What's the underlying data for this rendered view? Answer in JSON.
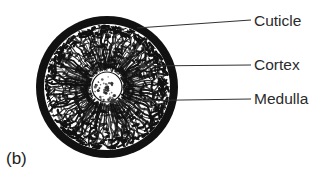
{
  "figure": {
    "panel_letter": "(b)",
    "background_color": "#ffffff",
    "ink_color": "#111111",
    "text_color": "#2b2b2b",
    "faint_bleedthrough_text": ""
  },
  "diagram": {
    "center_x": 107,
    "center_y": 87,
    "outer_radius": 71,
    "cuticle_ring_thickness": 8,
    "cortex_outer_radius": 63,
    "medulla_radius": 15,
    "cuticle_color": "#111111",
    "cortex_fill_color": "#ffffff",
    "cortex_pattern_color": "#111111",
    "medulla_fill_color": "#ffffff",
    "medulla_speckle_color": "#2a2a2a"
  },
  "labels": [
    {
      "id": "cuticle",
      "text": "Cuticle",
      "target_layer": "cuticle",
      "leader": {
        "x1": 137,
        "y1": 28,
        "x2": 251,
        "y2": 20,
        "dot": false
      }
    },
    {
      "id": "cortex",
      "text": "Cortex",
      "target_layer": "cortex",
      "leader": {
        "x1": 143,
        "y1": 66,
        "x2": 251,
        "y2": 65,
        "dot": true
      }
    },
    {
      "id": "medulla",
      "text": "Medulla",
      "target_layer": "medulla",
      "leader": {
        "x1": 113,
        "y1": 101,
        "x2": 251,
        "y2": 99,
        "dot": true
      }
    }
  ],
  "chart_data": {
    "type": "diagram",
    "title": "(b)",
    "structure": "concentric-rings",
    "layers": [
      {
        "name": "Cuticle",
        "position": "outermost",
        "appearance": "solid thick black ring"
      },
      {
        "name": "Cortex",
        "position": "middle",
        "appearance": "radially striated cellular texture"
      },
      {
        "name": "Medulla",
        "position": "central core",
        "appearance": "small pale speckled circle"
      }
    ],
    "legend": [
      "Cuticle",
      "Cortex",
      "Medulla"
    ],
    "legend_position": "right"
  }
}
